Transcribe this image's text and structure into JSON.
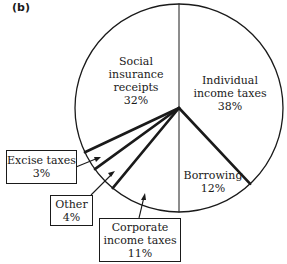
{
  "panel_label": "(b)",
  "chart_data": {
    "type": "pie",
    "title": "",
    "start_angle_deg": 0,
    "direction": "clockwise",
    "categories": [
      "Individual income taxes",
      "Borrowing",
      "Corporate income taxes",
      "Other",
      "Excise taxes",
      "Social insurance receipts"
    ],
    "values": [
      38,
      12,
      11,
      4,
      3,
      32
    ],
    "unit": "%",
    "slices": [
      {
        "label": "Individual income taxes",
        "lines": [
          "Individual",
          "income taxes",
          "38%"
        ],
        "value": 38,
        "placement": "inside"
      },
      {
        "label": "Borrowing",
        "lines": [
          "Borrowing",
          "12%"
        ],
        "value": 12,
        "placement": "inside"
      },
      {
        "label": "Corporate income taxes",
        "lines": [
          "Corporate",
          "income taxes",
          "11%"
        ],
        "value": 11,
        "placement": "callout"
      },
      {
        "label": "Other",
        "lines": [
          "Other",
          "4%"
        ],
        "value": 4,
        "placement": "callout"
      },
      {
        "label": "Excise taxes",
        "lines": [
          "Excise taxes",
          "3%"
        ],
        "value": 3,
        "placement": "callout"
      },
      {
        "label": "Social insurance receipts",
        "lines": [
          "Social",
          "insurance",
          "receipts",
          "32%"
        ],
        "value": 32,
        "placement": "inside"
      }
    ],
    "legend": "none"
  },
  "colors": {
    "ink": "#1a1a1a",
    "background": "#ffffff"
  }
}
